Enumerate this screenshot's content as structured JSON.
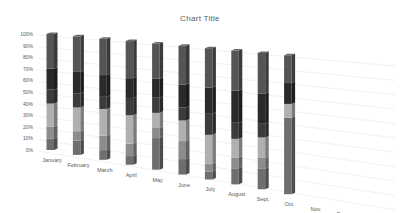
{
  "chart_data": {
    "type": "bar",
    "subtype": "3d-stacked-100-percent-column",
    "title": "Chart Title",
    "xlabel": "",
    "ylabel": "",
    "ylim": [
      0,
      100
    ],
    "y_ticks": [
      "0%",
      "10%",
      "20%",
      "30%",
      "40%",
      "50%",
      "60%",
      "70%",
      "80%",
      "90%",
      "100%"
    ],
    "grid": true,
    "legend": "none",
    "categories": [
      "January",
      "February",
      "March",
      "April",
      "May",
      "June",
      "July",
      "August",
      "Sept.",
      "Oct.",
      "Nov.",
      "Dec."
    ],
    "series": [
      {
        "name": "Series 1",
        "color": "#6e6e6e",
        "values": [
          10,
          12,
          8,
          7,
          25,
          12,
          6,
          12,
          15,
          55,
          0,
          0
        ]
      },
      {
        "name": "Series 2",
        "color": "#8c8c8c",
        "values": [
          10,
          8,
          12,
          10,
          8,
          14,
          6,
          8,
          8,
          0,
          0,
          0
        ]
      },
      {
        "name": "Series 3",
        "color": "#b0b0b0",
        "values": [
          20,
          20,
          22,
          23,
          12,
          16,
          22,
          14,
          15,
          10,
          0,
          0
        ]
      },
      {
        "name": "Series 4",
        "color": "#3c3c3c",
        "values": [
          12,
          12,
          10,
          14,
          12,
          10,
          16,
          12,
          10,
          0,
          0,
          0
        ]
      },
      {
        "name": "Series 5",
        "color": "#2a2a2a",
        "values": [
          18,
          18,
          18,
          16,
          15,
          18,
          20,
          24,
          22,
          15,
          0,
          0
        ]
      },
      {
        "name": "Series 6",
        "color": "#555555",
        "values": [
          30,
          30,
          30,
          30,
          28,
          30,
          30,
          30,
          30,
          20,
          0,
          0
        ]
      }
    ]
  }
}
